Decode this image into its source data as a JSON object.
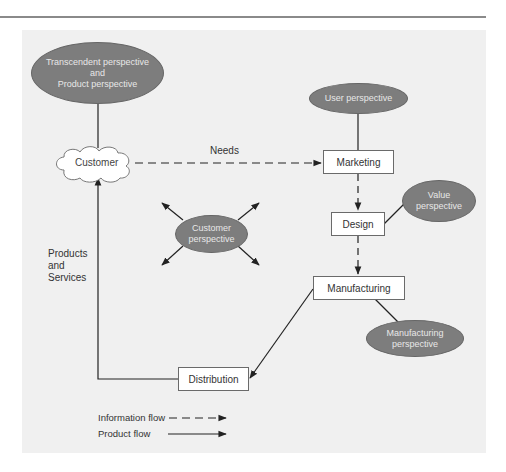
{
  "diagram": {
    "perspectives": {
      "transcendent": [
        "Transcendent perspective",
        "and",
        "Product perspective"
      ],
      "user": [
        "User perspective"
      ],
      "value": [
        "Value",
        "perspective"
      ],
      "customer": [
        "Customer",
        "perspective"
      ],
      "manufacturing": [
        "Manufacturing",
        "perspective"
      ]
    },
    "nodes": {
      "customer": "Customer",
      "marketing": "Marketing",
      "design": "Design",
      "manufacturing": "Manufacturing",
      "distribution": "Distribution"
    },
    "edge_labels": {
      "needs": "Needs",
      "products": [
        "Products",
        "and",
        "Services"
      ]
    },
    "legend": {
      "information_flow": "Information flow",
      "product_flow": "Product flow"
    },
    "colors": {
      "panel": "#f0f0f0",
      "ellipse": "#7d7d7d",
      "box": "#ffffff",
      "line": "#222222"
    }
  }
}
